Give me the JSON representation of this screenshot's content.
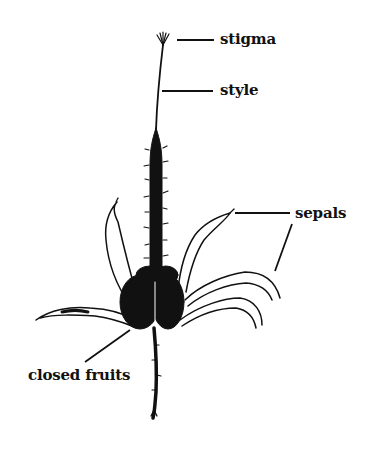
{
  "diagram": {
    "labels": [
      {
        "id": "stigma",
        "text": "stigma"
      },
      {
        "id": "style",
        "text": "style"
      },
      {
        "id": "sepals",
        "text": "sepals"
      },
      {
        "id": "closed_fruits",
        "text": "closed fruits"
      }
    ],
    "colors": {
      "ink": "#111111",
      "background": "#ffffff"
    }
  }
}
